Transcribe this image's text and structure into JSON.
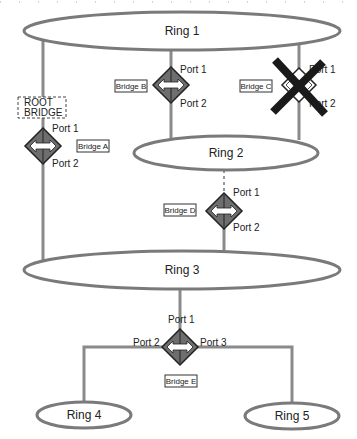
{
  "diagram": {
    "type": "ring topology with bridges",
    "rings": [
      {
        "id": "ring1",
        "label": "Ring 1"
      },
      {
        "id": "ring2",
        "label": "Ring 2"
      },
      {
        "id": "ring3",
        "label": "Ring 3"
      },
      {
        "id": "ring4",
        "label": "Ring 4"
      },
      {
        "id": "ring5",
        "label": "Ring 5"
      }
    ],
    "bridges": {
      "a": {
        "label": "Bridge A",
        "port1": "Port 1",
        "port2": "Port 2",
        "note": "ROOT",
        "note2": "BRIDGE"
      },
      "b": {
        "label": "Bridge B",
        "port1": "Port 1",
        "port2": "Port 2"
      },
      "c": {
        "label": "Bridge C",
        "port1": "Port 1",
        "port2": "Port 2",
        "status": "failed"
      },
      "d": {
        "label": "Bridge D",
        "port1": "Port 1",
        "port2": "Port 2",
        "link_status": "blocked"
      },
      "e": {
        "label": "Bridge E",
        "port1": "Port 1",
        "port2": "Port 2",
        "port3": "Port 3"
      }
    },
    "colors": {
      "ring_stroke": "#7a7a7a",
      "bridge_fill": "#6e6e6e",
      "failure_x": "#1a1a1a"
    }
  }
}
